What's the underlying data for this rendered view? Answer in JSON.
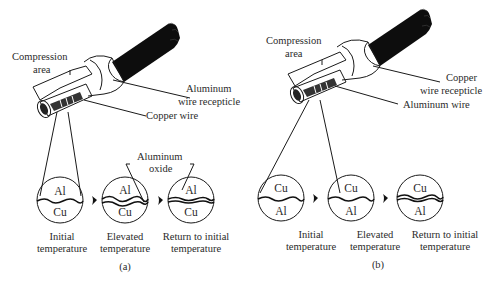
{
  "figure": {
    "panel_a": {
      "caption": "(a)",
      "callouts": {
        "compression_area_1": "Compression",
        "compression_area_2": "area",
        "receptacle_1": "Aluminum",
        "receptacle_2": "wire recepticle",
        "wire": "Copper wire",
        "oxide_1": "Aluminum",
        "oxide_2": "oxide"
      },
      "stages": [
        {
          "top": "Al",
          "bottom": "Cu",
          "label_1": "Initial",
          "label_2": "temperature"
        },
        {
          "top": "Al",
          "bottom": "Cu",
          "label_1": "Elevated",
          "label_2": "temperature"
        },
        {
          "top": "Al",
          "bottom": "Cu",
          "label_1": "Return to initial",
          "label_2": "temperature"
        }
      ]
    },
    "panel_b": {
      "caption": "(b)",
      "callouts": {
        "compression_area_1": "Compression",
        "compression_area_2": "area",
        "receptacle_1": "Copper",
        "receptacle_2": "wire recepticle",
        "wire": "Aluminum wire"
      },
      "stages": [
        {
          "top": "Cu",
          "bottom": "Al",
          "label_1": "Initial",
          "label_2": "temperature"
        },
        {
          "top": "Cu",
          "bottom": "Al",
          "label_1": "Elevated",
          "label_2": "temperature"
        },
        {
          "top": "Cu",
          "bottom": "Al",
          "label_1": "Return to initial",
          "label_2": "temperature"
        }
      ]
    }
  }
}
